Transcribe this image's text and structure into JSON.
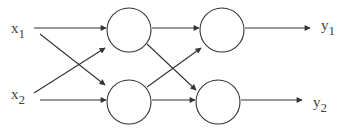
{
  "diagram": {
    "type": "neural-network",
    "stroke_color": "#333333",
    "background": "#ffffff",
    "inputs": [
      {
        "id": "x1",
        "base": "x",
        "sub": "1",
        "x": 11,
        "y": 33
      },
      {
        "id": "x2",
        "base": "x",
        "sub": "2",
        "x": 11,
        "y": 99
      }
    ],
    "outputs": [
      {
        "id": "y1",
        "base": "y",
        "sub": "1",
        "x": 321,
        "y": 30
      },
      {
        "id": "y2",
        "base": "y",
        "sub": "2",
        "x": 313,
        "y": 107
      }
    ],
    "nodes": [
      {
        "id": "h1",
        "cx": 129,
        "cy": 30,
        "r": 22
      },
      {
        "id": "h2",
        "cx": 129,
        "cy": 102,
        "r": 22
      },
      {
        "id": "o1",
        "cx": 222,
        "cy": 30,
        "r": 22
      },
      {
        "id": "o2",
        "cx": 218,
        "cy": 102,
        "r": 22
      }
    ],
    "edges": [
      {
        "from": "x1",
        "to": "h1",
        "x1": 34,
        "y1": 28,
        "x2": 106,
        "y2": 28
      },
      {
        "from": "x1",
        "to": "h2",
        "x1": 40,
        "y1": 34,
        "x2": 105,
        "y2": 85
      },
      {
        "from": "x2",
        "to": "h1",
        "x1": 34,
        "y1": 93,
        "x2": 105,
        "y2": 48
      },
      {
        "from": "x2",
        "to": "h2",
        "x1": 40,
        "y1": 100,
        "x2": 106,
        "y2": 100
      },
      {
        "from": "h1",
        "to": "o1",
        "x1": 152,
        "y1": 28,
        "x2": 199,
        "y2": 28
      },
      {
        "from": "h1",
        "to": "o2",
        "x1": 147,
        "y1": 44,
        "x2": 196,
        "y2": 90
      },
      {
        "from": "h2",
        "to": "o1",
        "x1": 147,
        "y1": 87,
        "x2": 201,
        "y2": 48
      },
      {
        "from": "h2",
        "to": "o2",
        "x1": 152,
        "y1": 100,
        "x2": 195,
        "y2": 100
      },
      {
        "from": "o1",
        "to": "y1",
        "x1": 245,
        "y1": 28,
        "x2": 310,
        "y2": 28
      },
      {
        "from": "o2",
        "to": "y2",
        "x1": 241,
        "y1": 100,
        "x2": 302,
        "y2": 100
      }
    ]
  }
}
